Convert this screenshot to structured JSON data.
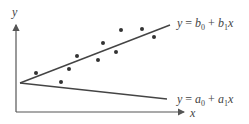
{
  "figure": {
    "type": "regression-diagram",
    "colors": {
      "axis": "#555555",
      "line": "#444444",
      "point": "#333333",
      "background": "#ffffff"
    }
  },
  "axes": {
    "x_label": "x",
    "y_label": "y"
  },
  "lines": [
    {
      "name": "upper-fit",
      "label": {
        "lhs": "y",
        "eq": "=",
        "c0": "b",
        "c0_sub": "0",
        "plus": "+",
        "c1": "b",
        "c1_sub": "1",
        "var": "x"
      },
      "start": [
        20,
        83
      ],
      "end": [
        170,
        25
      ]
    },
    {
      "name": "lower-fit",
      "label": {
        "lhs": "y",
        "eq": "=",
        "c0": "a",
        "c0_sub": "0",
        "plus": "+",
        "c1": "a",
        "c1_sub": "1",
        "var": "x"
      },
      "start": [
        20,
        83
      ],
      "end": [
        167,
        99
      ]
    }
  ],
  "chart_data": {
    "type": "scatter",
    "title": "",
    "xlabel": "x",
    "ylabel": "y",
    "grid": false,
    "legend": "none",
    "annotations": [
      "y = b0 + b1x",
      "y = a0 + a1x"
    ],
    "points_px": [
      [
        36,
        73
      ],
      [
        61,
        82
      ],
      [
        69,
        69
      ],
      [
        77,
        56
      ],
      [
        98,
        60
      ],
      [
        103,
        43
      ],
      [
        116,
        52
      ],
      [
        121,
        30
      ],
      [
        142,
        29
      ],
      [
        154,
        37
      ]
    ],
    "series": [
      {
        "name": "y = b0 + b1x",
        "kind": "line",
        "from_px": [
          20,
          83
        ],
        "to_px": [
          170,
          25
        ]
      },
      {
        "name": "y = a0 + a1x",
        "kind": "line",
        "from_px": [
          20,
          83
        ],
        "to_px": [
          167,
          99
        ]
      }
    ]
  }
}
